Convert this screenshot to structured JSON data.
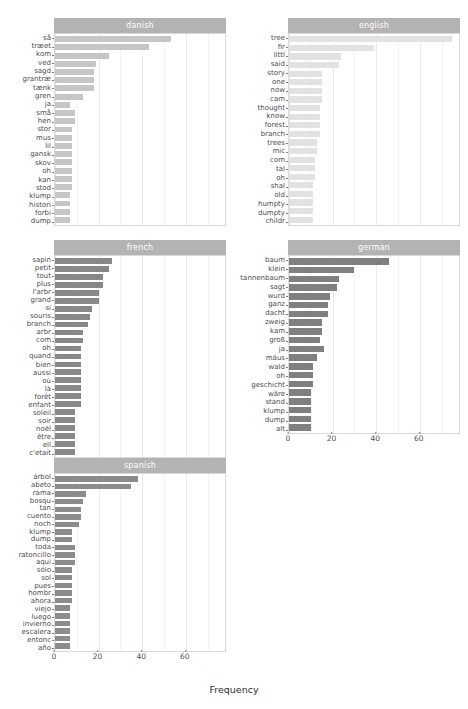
{
  "chart_data": {
    "type": "bar",
    "title": "",
    "xlabel": "Frequency",
    "ylabel": "",
    "xlim": [
      0,
      78
    ],
    "xticks": [
      0,
      20,
      40,
      60
    ],
    "grid": true,
    "orientation": "horizontal",
    "facets": [
      {
        "name": "danish",
        "color": "#c6c6c6",
        "categories": [
          "så",
          "træet",
          "kom",
          "ved",
          "sagd",
          "grantræ",
          "tænk",
          "gren",
          "ja",
          "små",
          "hen",
          "stor",
          "mus",
          "lil",
          "gansk",
          "skov",
          "oh",
          "kan",
          "stod",
          "klump",
          "histori",
          "forbi",
          "dump"
        ],
        "values": [
          53,
          43,
          25,
          19,
          18,
          18,
          18,
          13,
          7,
          9,
          9,
          8,
          8,
          8,
          8,
          8,
          8,
          8,
          8,
          7,
          7,
          7,
          7
        ]
      },
      {
        "name": "english",
        "color": "#e2e2e2",
        "categories": [
          "tree",
          "fir",
          "littl",
          "said",
          "story",
          "one",
          "now",
          "cam",
          "thought",
          "know",
          "forest",
          "branch",
          "trees",
          "mic",
          "com",
          "tal",
          "oh",
          "shal",
          "old",
          "humpty",
          "dumpty",
          "childr"
        ],
        "values": [
          75,
          39,
          24,
          23,
          15,
          15,
          15,
          15,
          14,
          14,
          14,
          14,
          13,
          13,
          12,
          12,
          12,
          11,
          11,
          11,
          11,
          11
        ]
      },
      {
        "name": "french",
        "color": "#888888",
        "categories": [
          "sapin",
          "petit",
          "tout",
          "plus",
          "l'arbr",
          "grand",
          "si",
          "souris",
          "branch",
          "arbr",
          "com",
          "oh",
          "quand",
          "bien",
          "aussi",
          "où",
          "là",
          "forêt",
          "enfant",
          "soleil",
          "soir",
          "noël",
          "être",
          "ell",
          "c'etait"
        ],
        "values": [
          26,
          25,
          22,
          22,
          20,
          20,
          17,
          16,
          15,
          13,
          13,
          12,
          12,
          12,
          12,
          12,
          12,
          12,
          12,
          9,
          9,
          9,
          9,
          9,
          9
        ]
      },
      {
        "name": "german",
        "color": "#808080",
        "categories": [
          "baum",
          "klein",
          "tannenbaum",
          "sagt",
          "wurd",
          "ganz",
          "dacht",
          "zweig",
          "kam",
          "groß",
          "ja",
          "mäus",
          "wald",
          "oh",
          "geschicht",
          "wäre",
          "stand",
          "klump",
          "dump",
          "alt"
        ],
        "values": [
          46,
          30,
          23,
          22,
          19,
          18,
          18,
          15,
          15,
          14,
          16,
          13,
          11,
          11,
          11,
          10,
          10,
          10,
          10,
          10
        ]
      },
      {
        "name": "spanish",
        "color": "#8c8c8c",
        "categories": [
          "árbol",
          "abeto",
          "rama",
          "bosqu",
          "tan",
          "cuento",
          "noch",
          "klump",
          "dump",
          "toda",
          "ratoncillo",
          "aqui",
          "sólo",
          "sol",
          "pues",
          "hombr",
          "ahora",
          "viejo",
          "luego",
          "invierno",
          "escalera",
          "entonc",
          "año"
        ],
        "values": [
          38,
          35,
          14,
          13,
          12,
          12,
          11,
          8,
          8,
          9,
          9,
          9,
          8,
          8,
          8,
          8,
          8,
          7,
          7,
          7,
          7,
          7,
          7
        ]
      }
    ]
  }
}
